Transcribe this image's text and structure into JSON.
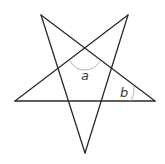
{
  "diagram": {
    "type": "pentagram",
    "colors": {
      "line": "#2b2b2b",
      "arc": "#b5b5b5",
      "label": "#3a3a3a",
      "background": "#ffffff"
    },
    "vertices": {
      "top_left": [
        41,
        15
      ],
      "top_right": [
        128,
        15
      ],
      "left": [
        15,
        101
      ],
      "right": [
        155,
        101
      ],
      "bottom": [
        85,
        153
      ]
    },
    "angles": [
      {
        "label": "a",
        "position": [
          85,
          80
        ]
      },
      {
        "label": "b",
        "position": [
          120,
          97
        ]
      }
    ]
  }
}
